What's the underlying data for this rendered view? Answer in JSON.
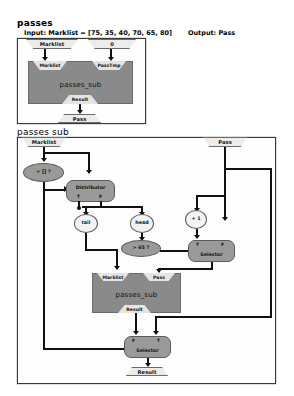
{
  "header": {
    "title": "passes",
    "input_label": "Input: Marklist = [75, 35, 40, 70, 65, 80]",
    "output_label": "Output: Pass"
  },
  "top_diagram": {
    "inputs": [
      {
        "name": "marklist-input",
        "label": "Marklist"
      },
      {
        "name": "zero-input",
        "label": "0"
      }
    ],
    "process": {
      "label": "passes_sub",
      "in_ports": [
        "Marklist",
        "PassTmp"
      ],
      "out_port": "Result"
    },
    "output": {
      "label": "Pass"
    }
  },
  "sub_diagram": {
    "title": "passes sub",
    "inputs": [
      {
        "name": "marklist-input",
        "label": "Marklist"
      },
      {
        "name": "pass-input",
        "label": "Pass"
      }
    ],
    "nodes": {
      "empty_test": "= [] ?",
      "distributor": "Distributor",
      "distributor_ports": [
        "T",
        "F"
      ],
      "tail": "tail",
      "head": "head",
      "compare": "> 65 ?",
      "increment": "+ 1",
      "selector_upper": "Selector",
      "selector_upper_ports": [
        "T",
        "F"
      ],
      "selector_lower": "Selector",
      "selector_lower_ports": [
        "F",
        "T"
      ]
    },
    "process": {
      "label": "passes_sub",
      "in_ports": [
        "Marklist",
        "Pass"
      ],
      "out_port": "Result"
    },
    "output": {
      "label": "Result"
    }
  },
  "colors": {
    "process_fill": "#8a8a8a",
    "node_fill": "#9a9a9a",
    "node_light": "#f3f3f3",
    "port_fill": "#ececec",
    "line": "#111111"
  }
}
